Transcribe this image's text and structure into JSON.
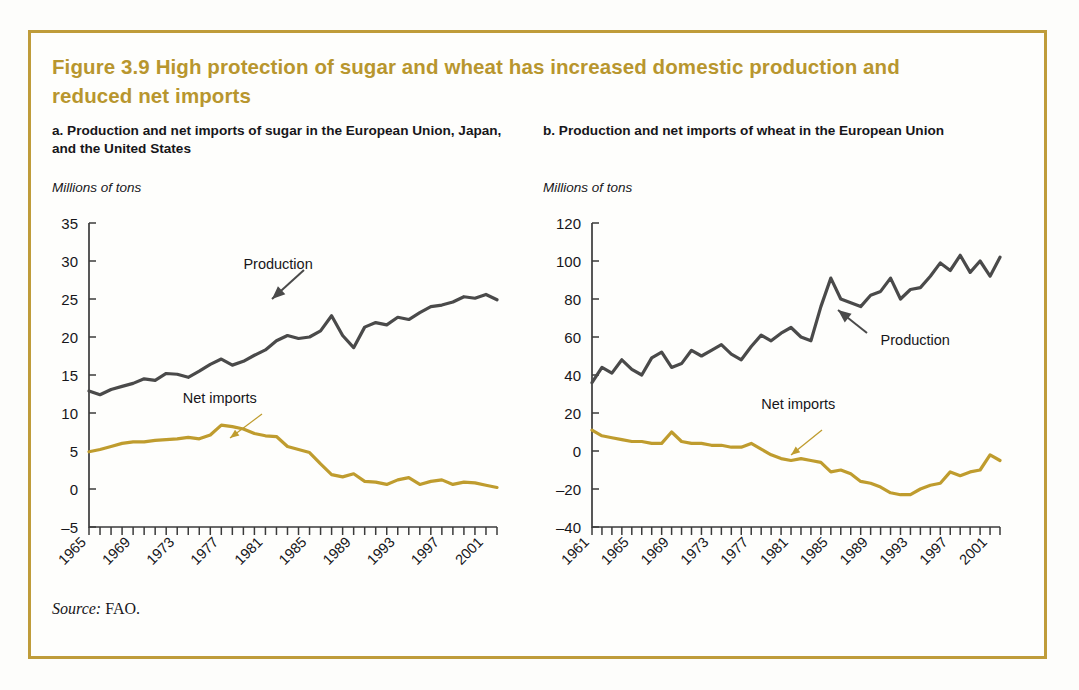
{
  "figure": {
    "title": "Figure 3.9  High protection of sugar and wheat has increased domestic production and reduced net imports",
    "source_key": "Source:",
    "source_value": " FAO.",
    "border_color": "#bf9c3a",
    "title_color": "#b8962e"
  },
  "panels": {
    "a": {
      "heading": "a. Production and net imports of sugar in the European Union, Japan, and the United States",
      "unit_label": "Millions of tons"
    },
    "b": {
      "heading": "b. Production and net imports of wheat in the European Union",
      "unit_label": "Millions of tons"
    }
  },
  "series_colors": {
    "production": "#4a4a4a",
    "net_imports": "#bf9c2e"
  },
  "chart_data": [
    {
      "type": "line",
      "id": "panel-a",
      "title": "a. Production and net imports of sugar in the European Union, Japan, and the United States",
      "xlabel": "",
      "ylabel": "Millions of tons",
      "ylim": [
        -5,
        35
      ],
      "yticks": [
        -5,
        0,
        5,
        10,
        15,
        20,
        25,
        30,
        35
      ],
      "ytick_labels": [
        "–5",
        "0",
        "5",
        "10",
        "15",
        "20",
        "25",
        "30",
        "35"
      ],
      "xlim": [
        1965,
        2002
      ],
      "xticks_all": [
        1965,
        1966,
        1967,
        1968,
        1969,
        1970,
        1971,
        1972,
        1973,
        1974,
        1975,
        1976,
        1977,
        1978,
        1979,
        1980,
        1981,
        1982,
        1983,
        1984,
        1985,
        1986,
        1987,
        1988,
        1989,
        1990,
        1991,
        1992,
        1993,
        1994,
        1995,
        1996,
        1997,
        1998,
        1999,
        2000,
        2001,
        2002
      ],
      "xtick_labels": [
        "1965",
        "1969",
        "1973",
        "1977",
        "1981",
        "1985",
        "1989",
        "1993",
        "1997",
        "2001"
      ],
      "xtick_label_years": [
        1965,
        1969,
        1973,
        1977,
        1981,
        1985,
        1989,
        1993,
        1997,
        2001
      ],
      "grid": false,
      "legend_position": "inline-annotations",
      "annotations": [
        {
          "text": "Production",
          "x": 1979.0,
          "y": 29.0
        },
        {
          "text": "Net imports",
          "x": 1973.5,
          "y": 11.3
        }
      ],
      "x": [
        1965,
        1966,
        1967,
        1968,
        1969,
        1970,
        1971,
        1972,
        1973,
        1974,
        1975,
        1976,
        1977,
        1978,
        1979,
        1980,
        1981,
        1982,
        1983,
        1984,
        1985,
        1986,
        1987,
        1988,
        1989,
        1990,
        1991,
        1992,
        1993,
        1994,
        1995,
        1996,
        1997,
        1998,
        1999,
        2000,
        2001,
        2002
      ],
      "series": [
        {
          "name": "Production",
          "color": "#4a4a4a",
          "values": [
            12.9,
            12.4,
            13.1,
            13.5,
            13.9,
            14.5,
            14.3,
            15.2,
            15.1,
            14.7,
            15.5,
            16.4,
            17.1,
            16.3,
            16.8,
            17.6,
            18.3,
            19.5,
            20.2,
            19.8,
            20.0,
            20.8,
            22.8,
            20.2,
            18.6,
            21.3,
            21.9,
            21.6,
            22.6,
            22.3,
            23.2,
            24.0,
            24.2,
            24.6,
            25.3,
            25.1,
            25.6,
            24.9
          ]
        },
        {
          "name": "Net imports",
          "color": "#bf9c2e",
          "values": [
            4.9,
            5.2,
            5.6,
            6.0,
            6.2,
            6.2,
            6.4,
            6.5,
            6.6,
            6.8,
            6.6,
            7.1,
            8.4,
            8.2,
            7.9,
            7.3,
            7.0,
            6.9,
            5.6,
            5.2,
            4.8,
            3.3,
            1.9,
            1.6,
            2.0,
            1.0,
            0.9,
            0.6,
            1.2,
            1.5,
            0.6,
            1.0,
            1.2,
            0.6,
            0.9,
            0.8,
            0.5,
            0.2
          ]
        }
      ]
    },
    {
      "type": "line",
      "id": "panel-b",
      "title": "b. Production and net imports of wheat in the European Union",
      "xlabel": "",
      "ylabel": "Millions of tons",
      "ylim": [
        -40,
        120
      ],
      "yticks": [
        -40,
        -20,
        0,
        20,
        40,
        60,
        80,
        100,
        120
      ],
      "ytick_labels": [
        "–40",
        "–20",
        "0",
        "20",
        "40",
        "60",
        "80",
        "100",
        "120"
      ],
      "xlim": [
        1961,
        2002
      ],
      "xticks_all": [
        1961,
        1962,
        1963,
        1964,
        1965,
        1966,
        1967,
        1968,
        1969,
        1970,
        1971,
        1972,
        1973,
        1974,
        1975,
        1976,
        1977,
        1978,
        1979,
        1980,
        1981,
        1982,
        1983,
        1984,
        1985,
        1986,
        1987,
        1988,
        1989,
        1990,
        1991,
        1992,
        1993,
        1994,
        1995,
        1996,
        1997,
        1998,
        1999,
        2000,
        2001,
        2002
      ],
      "xtick_labels": [
        "1961",
        "1965",
        "1969",
        "1973",
        "1977",
        "1981",
        "1985",
        "1989",
        "1993",
        "1997",
        "2001"
      ],
      "xtick_label_years": [
        1961,
        1965,
        1969,
        1973,
        1977,
        1981,
        1985,
        1989,
        1993,
        1997,
        2001
      ],
      "grid": false,
      "legend_position": "inline-annotations",
      "annotations": [
        {
          "text": "Production",
          "x": 1990.0,
          "y": 56.0
        },
        {
          "text": "Net imports",
          "x": 1978.0,
          "y": 22.0
        }
      ],
      "x": [
        1961,
        1962,
        1963,
        1964,
        1965,
        1966,
        1967,
        1968,
        1969,
        1970,
        1971,
        1972,
        1973,
        1974,
        1975,
        1976,
        1977,
        1978,
        1979,
        1980,
        1981,
        1982,
        1983,
        1984,
        1985,
        1986,
        1987,
        1988,
        1989,
        1990,
        1991,
        1992,
        1993,
        1994,
        1995,
        1996,
        1997,
        1998,
        1999,
        2000,
        2001,
        2002
      ],
      "series": [
        {
          "name": "Production",
          "color": "#4a4a4a",
          "values": [
            36,
            44,
            41,
            48,
            43,
            40,
            49,
            52,
            44,
            46,
            53,
            50,
            53,
            56,
            51,
            48,
            55,
            61,
            58,
            62,
            65,
            60,
            58,
            76,
            91,
            80,
            78,
            76,
            82,
            84,
            91,
            80,
            85,
            86,
            92,
            99,
            95,
            103,
            94,
            100,
            92,
            102
          ]
        },
        {
          "name": "Net imports",
          "color": "#bf9c2e",
          "values": [
            11,
            8,
            7,
            6,
            5,
            5,
            4,
            4,
            10,
            5,
            4,
            4,
            3,
            3,
            2,
            2,
            4,
            1,
            -2,
            -4,
            -5,
            -4,
            -5,
            -6,
            -11,
            -10,
            -12,
            -16,
            -17,
            -19,
            -22,
            -23,
            -23,
            -20,
            -18,
            -17,
            -11,
            -13,
            -11,
            -10,
            -2,
            -5
          ]
        }
      ]
    }
  ]
}
